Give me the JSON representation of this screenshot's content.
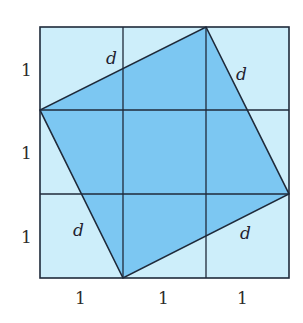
{
  "figure": {
    "colors": {
      "outer_fill": "#cdeefa",
      "inner_fill": "#7cc7f2",
      "line": "#1f2a3a",
      "background": "#ffffff"
    },
    "grid": {
      "rows": 3,
      "cols": 3,
      "unit": 1
    },
    "inner_square_vertices_units": [
      {
        "x": 2,
        "y": 3
      },
      {
        "x": 3,
        "y": 1
      },
      {
        "x": 1,
        "y": 0
      },
      {
        "x": 0,
        "y": 2
      }
    ],
    "labels": {
      "side_label": "d",
      "bottom_units": [
        "1",
        "1",
        "1"
      ],
      "left_units": [
        "1",
        "1",
        "1"
      ],
      "d_labels": [
        "d",
        "d",
        "d",
        "d"
      ]
    }
  }
}
